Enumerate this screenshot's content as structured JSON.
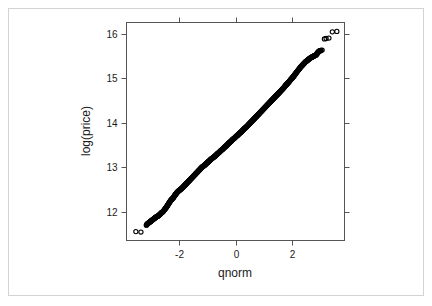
{
  "figure": {
    "name": "qq-plot-log-price",
    "width": 432,
    "height": 306,
    "background_color": "#ffffff",
    "border_color": "#d3d3d3",
    "axis_color": "#555555",
    "point_color": "#000000"
  },
  "chart_data": {
    "type": "scatter",
    "title": "",
    "subtitle": "",
    "xlabel": "qnorm",
    "ylabel": "log(price)",
    "xlim": [
      -3.85,
      3.85
    ],
    "ylim": [
      11.35,
      16.25
    ],
    "xticks": [
      -2,
      0,
      2
    ],
    "xtick_labels": [
      "-2",
      "0",
      "2"
    ],
    "yticks": [
      12,
      13,
      14,
      15,
      16
    ],
    "ytick_labels": [
      "12",
      "13",
      "14",
      "15",
      "16"
    ],
    "grid": false,
    "legend": null,
    "marker": "open-circle",
    "annotations": [],
    "series": [
      {
        "name": "log(price) quantiles",
        "x": [
          -3.52,
          -3.34,
          -3.12,
          -3.04,
          -2.98,
          -2.92,
          -2.86,
          -2.8,
          -2.74,
          -2.68,
          -2.62,
          -2.56,
          -2.5,
          -2.44,
          -2.38,
          -2.32,
          -2.26,
          -2.2,
          -2.14,
          -2.08,
          -2.02,
          -1.96,
          -1.9,
          -1.84,
          -1.78,
          -1.72,
          -1.66,
          -1.6,
          -1.54,
          -1.48,
          -1.42,
          -1.36,
          -1.3,
          -1.24,
          -1.18,
          -1.12,
          -1.06,
          -1.0,
          -0.94,
          -0.88,
          -0.82,
          -0.76,
          -0.7,
          -0.64,
          -0.58,
          -0.52,
          -0.46,
          -0.4,
          -0.34,
          -0.28,
          -0.22,
          -0.16,
          -0.1,
          -0.04,
          0.02,
          0.08,
          0.14,
          0.2,
          0.26,
          0.32,
          0.38,
          0.44,
          0.5,
          0.56,
          0.62,
          0.68,
          0.74,
          0.8,
          0.86,
          0.92,
          0.98,
          1.04,
          1.1,
          1.16,
          1.22,
          1.28,
          1.34,
          1.4,
          1.46,
          1.52,
          1.58,
          1.64,
          1.7,
          1.76,
          1.82,
          1.88,
          1.94,
          2.0,
          2.06,
          2.12,
          2.18,
          2.24,
          2.3,
          2.36,
          2.42,
          2.48,
          2.54,
          2.6,
          2.66,
          2.72,
          2.78,
          2.84,
          2.9,
          2.96,
          3.06,
          3.14,
          3.2,
          3.3,
          3.42,
          3.58
        ],
        "y": [
          11.55,
          11.54,
          11.72,
          11.76,
          11.79,
          11.82,
          11.85,
          11.88,
          11.9,
          11.93,
          11.97,
          12.0,
          12.05,
          12.1,
          12.16,
          12.22,
          12.27,
          12.31,
          12.37,
          12.42,
          12.46,
          12.49,
          12.52,
          12.56,
          12.6,
          12.64,
          12.68,
          12.72,
          12.76,
          12.8,
          12.84,
          12.88,
          12.92,
          12.96,
          13.0,
          13.03,
          13.06,
          13.1,
          13.13,
          13.17,
          13.2,
          13.23,
          13.26,
          13.3,
          13.33,
          13.37,
          13.4,
          13.44,
          13.47,
          13.51,
          13.55,
          13.58,
          13.62,
          13.65,
          13.69,
          13.72,
          13.76,
          13.79,
          13.83,
          13.87,
          13.9,
          13.94,
          13.98,
          14.02,
          14.06,
          14.1,
          14.14,
          14.18,
          14.22,
          14.26,
          14.3,
          14.34,
          14.38,
          14.42,
          14.46,
          14.5,
          14.54,
          14.58,
          14.62,
          14.66,
          14.7,
          14.74,
          14.78,
          14.83,
          14.87,
          14.91,
          14.96,
          15.0,
          15.05,
          15.1,
          15.15,
          15.2,
          15.25,
          15.29,
          15.33,
          15.37,
          15.4,
          15.43,
          15.46,
          15.48,
          15.5,
          15.52,
          15.57,
          15.61,
          15.63,
          15.88,
          15.89,
          15.9,
          16.04,
          16.05
        ]
      }
    ]
  }
}
